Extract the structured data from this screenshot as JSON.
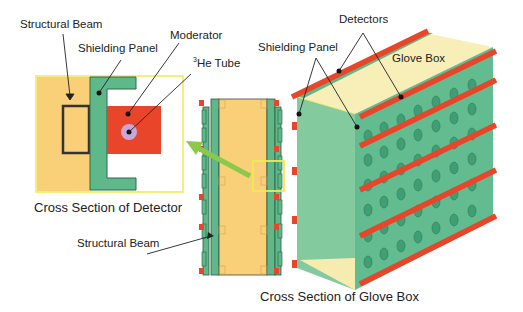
{
  "labels": {
    "structural_beam_top": "Structural Beam",
    "shielding_panel_left": "Shielding Panel",
    "moderator": "Moderator",
    "he_tube_sup": "3",
    "he_tube": "He Tube",
    "detectors": "Detectors",
    "shielding_panel_right": "Shielding Panel",
    "glove_box": "Glove Box",
    "structural_beam_bottom": "Structural Beam"
  },
  "captions": {
    "detector": "Cross Section of Detector",
    "glove_box": "Cross Section of Glove Box"
  },
  "colors": {
    "beam_yellow": "#f9cf78",
    "shield_green": "#5fb88a",
    "moderator_red": "#e8452a",
    "tube_lavender": "#c9a6d6",
    "highlight_yellow": "#eeea55",
    "arrow_green": "#8cc84b",
    "box_pale": "#f7ecb0",
    "outline_dark": "#333333"
  }
}
